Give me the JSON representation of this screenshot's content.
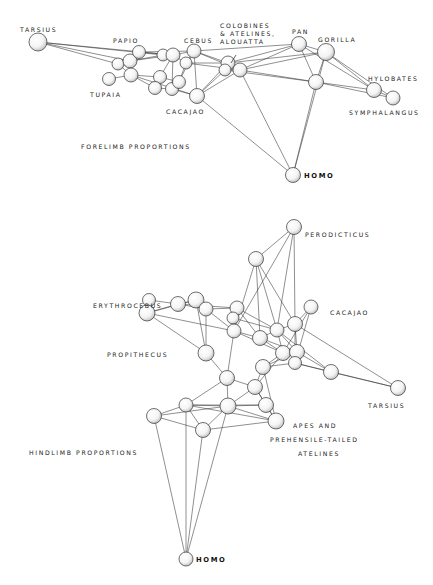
{
  "diagrams": [
    {
      "id": "forelimb",
      "title": "FORELIMB PROPORTIONS",
      "labels": [
        {
          "text": "TARSIUS",
          "x": 20,
          "y": 26
        },
        {
          "text": "PAPIO",
          "x": 113,
          "y": 37
        },
        {
          "text": "CEBUS",
          "x": 184,
          "y": 37
        },
        {
          "text": "COLOBINES\n& ATELINES,\nALOUATTA",
          "x": 220,
          "y": 22
        },
        {
          "text": "PAN",
          "x": 292,
          "y": 28
        },
        {
          "text": "GORILLA",
          "x": 318,
          "y": 36
        },
        {
          "text": "HYLOBATES",
          "x": 368,
          "y": 75
        },
        {
          "text": "SYMPHALANGUS",
          "x": 349,
          "y": 109
        },
        {
          "text": "TUPAIA",
          "x": 90,
          "y": 91
        },
        {
          "text": "CACAJAO",
          "x": 166,
          "y": 108
        },
        {
          "text": "FORELIMB PROPORTIONS",
          "x": 81,
          "y": 143
        },
        {
          "text": "HOMO",
          "x": 304,
          "y": 172,
          "bold": true
        }
      ],
      "nodes": [
        {
          "id": "tarsius",
          "x": 38,
          "y": 42,
          "r": 9
        },
        {
          "id": "p1",
          "x": 118,
          "y": 64,
          "r": 6
        },
        {
          "id": "p2",
          "x": 130,
          "y": 61,
          "r": 7
        },
        {
          "id": "papio",
          "x": 139,
          "y": 52,
          "r": 6.5
        },
        {
          "id": "p3",
          "x": 131,
          "y": 75,
          "r": 7
        },
        {
          "id": "tupaia",
          "x": 109,
          "y": 79,
          "r": 6.5
        },
        {
          "id": "c1",
          "x": 163,
          "y": 55,
          "r": 6
        },
        {
          "id": "c2",
          "x": 173,
          "y": 55,
          "r": 7
        },
        {
          "id": "cebus",
          "x": 194,
          "y": 51,
          "r": 7
        },
        {
          "id": "c3",
          "x": 186,
          "y": 63,
          "r": 6
        },
        {
          "id": "m1",
          "x": 160,
          "y": 77,
          "r": 6.5
        },
        {
          "id": "m2",
          "x": 155,
          "y": 88,
          "r": 6.5
        },
        {
          "id": "m3",
          "x": 172,
          "y": 89,
          "r": 6.5
        },
        {
          "id": "m4",
          "x": 179,
          "y": 82,
          "r": 6.5
        },
        {
          "id": "cacajao",
          "x": 197,
          "y": 96,
          "r": 7.5
        },
        {
          "id": "col1",
          "x": 228,
          "y": 63,
          "r": 7
        },
        {
          "id": "col2",
          "x": 225,
          "y": 70,
          "r": 6
        },
        {
          "id": "col3",
          "x": 240,
          "y": 70,
          "r": 7
        },
        {
          "id": "pan",
          "x": 299,
          "y": 44,
          "r": 7.5
        },
        {
          "id": "gorilla",
          "x": 326,
          "y": 52,
          "r": 8.5
        },
        {
          "id": "mid",
          "x": 316,
          "y": 82,
          "r": 7.5
        },
        {
          "id": "hylobates",
          "x": 374,
          "y": 90,
          "r": 7.5
        },
        {
          "id": "symphalangus",
          "x": 393,
          "y": 98,
          "r": 7
        },
        {
          "id": "homo",
          "x": 293,
          "y": 175,
          "r": 7.5
        }
      ],
      "edges": [
        [
          "tarsius",
          "p1"
        ],
        [
          "tarsius",
          "p2"
        ],
        [
          "tarsius",
          "c1"
        ],
        [
          "tarsius",
          "c2"
        ],
        [
          "p1",
          "p2"
        ],
        [
          "p1",
          "p3"
        ],
        [
          "p2",
          "papio"
        ],
        [
          "p2",
          "p3"
        ],
        [
          "p2",
          "c1"
        ],
        [
          "p2",
          "c2"
        ],
        [
          "papio",
          "c2"
        ],
        [
          "papio",
          "cebus"
        ],
        [
          "p3",
          "m1"
        ],
        [
          "p3",
          "m2"
        ],
        [
          "p3",
          "cacajao"
        ],
        [
          "tupaia",
          "p3"
        ],
        [
          "c1",
          "c2"
        ],
        [
          "c2",
          "cebus"
        ],
        [
          "c2",
          "c3"
        ],
        [
          "c3",
          "cebus"
        ],
        [
          "c3",
          "m4"
        ],
        [
          "c2",
          "m1"
        ],
        [
          "c2",
          "m3"
        ],
        [
          "m1",
          "m2"
        ],
        [
          "m1",
          "m4"
        ],
        [
          "m2",
          "m3"
        ],
        [
          "m3",
          "m4"
        ],
        [
          "m4",
          "cebus"
        ],
        [
          "m3",
          "cacajao"
        ],
        [
          "cebus",
          "col1"
        ],
        [
          "cebus",
          "col3"
        ],
        [
          "cebus",
          "pan"
        ],
        [
          "cebus",
          "cacajao"
        ],
        [
          "c3",
          "col1"
        ],
        [
          "c3",
          "col3"
        ],
        [
          "col1",
          "col2"
        ],
        [
          "col1",
          "col3"
        ],
        [
          "col2",
          "col3"
        ],
        [
          "col1",
          "pan"
        ],
        [
          "col3",
          "pan"
        ],
        [
          "col3",
          "gorilla"
        ],
        [
          "col1",
          "gorilla"
        ],
        [
          "col3",
          "mid"
        ],
        [
          "col2",
          "mid"
        ],
        [
          "cacajao",
          "col1"
        ],
        [
          "cacajao",
          "col3"
        ],
        [
          "cacajao",
          "col2"
        ],
        [
          "pan",
          "gorilla"
        ],
        [
          "pan",
          "mid"
        ],
        [
          "gorilla",
          "mid"
        ],
        [
          "gorilla",
          "hylobates"
        ],
        [
          "pan",
          "hylobates"
        ],
        [
          "mid",
          "hylobates"
        ],
        [
          "mid",
          "symphalangus"
        ],
        [
          "hylobates",
          "symphalangus"
        ],
        [
          "gorilla",
          "symphalangus"
        ],
        [
          "homo",
          "cacajao"
        ],
        [
          "homo",
          "col3"
        ],
        [
          "homo",
          "gorilla"
        ],
        [
          "homo",
          "mid"
        ]
      ]
    },
    {
      "id": "hindlimb",
      "title": "HINDLIMB PROPORTIONS",
      "labels": [
        {
          "text": "PERODICTICUS",
          "x": 305,
          "y": 231
        },
        {
          "text": "ERYTHROCEBUS",
          "x": 93,
          "y": 302
        },
        {
          "text": "CACAJAO",
          "x": 330,
          "y": 309
        },
        {
          "text": "PROPITHECUS",
          "x": 107,
          "y": 351
        },
        {
          "text": "TARSIUS",
          "x": 368,
          "y": 402
        },
        {
          "text": "APES  AND",
          "x": 293,
          "y": 422
        },
        {
          "text": "PREHENSILE-TAILED",
          "x": 270,
          "y": 436
        },
        {
          "text": "ATELINES",
          "x": 298,
          "y": 450
        },
        {
          "text": "HINDLIMB PROPORTIONS",
          "x": 29,
          "y": 449
        },
        {
          "text": "HOMO",
          "x": 196,
          "y": 556,
          "bold": true
        }
      ],
      "nodes": [
        {
          "id": "perodicticus",
          "x": 294,
          "y": 227,
          "r": 7.5
        },
        {
          "id": "n2",
          "x": 256,
          "y": 259,
          "r": 7.5
        },
        {
          "id": "e1",
          "x": 196,
          "y": 300,
          "r": 8
        },
        {
          "id": "e2",
          "x": 206,
          "y": 309,
          "r": 7
        },
        {
          "id": "pr1",
          "x": 149,
          "y": 300,
          "r": 6.5
        },
        {
          "id": "pr2",
          "x": 147,
          "y": 313,
          "r": 8
        },
        {
          "id": "e3",
          "x": 178,
          "y": 304,
          "r": 7.5
        },
        {
          "id": "k1",
          "x": 237,
          "y": 308,
          "r": 7
        },
        {
          "id": "k2",
          "x": 233,
          "y": 318,
          "r": 6
        },
        {
          "id": "propithecus",
          "x": 206,
          "y": 353,
          "r": 8
        },
        {
          "id": "k3",
          "x": 234,
          "y": 331,
          "r": 7
        },
        {
          "id": "k4",
          "x": 260,
          "y": 338,
          "r": 7.5
        },
        {
          "id": "k5",
          "x": 277,
          "y": 330,
          "r": 7
        },
        {
          "id": "k6",
          "x": 295,
          "y": 324,
          "r": 7.5
        },
        {
          "id": "cacajao",
          "x": 311,
          "y": 307,
          "r": 7
        },
        {
          "id": "k7",
          "x": 283,
          "y": 353,
          "r": 7.5
        },
        {
          "id": "k8",
          "x": 297,
          "y": 352,
          "r": 7.5
        },
        {
          "id": "k9",
          "x": 263,
          "y": 367,
          "r": 7.5
        },
        {
          "id": "k10",
          "x": 295,
          "y": 363,
          "r": 6.5
        },
        {
          "id": "k11",
          "x": 227,
          "y": 378,
          "r": 7.5
        },
        {
          "id": "k12",
          "x": 255,
          "y": 387,
          "r": 7.5
        },
        {
          "id": "k13",
          "x": 266,
          "y": 405,
          "r": 7.5
        },
        {
          "id": "k14",
          "x": 331,
          "y": 372,
          "r": 7.5
        },
        {
          "id": "tarsius",
          "x": 398,
          "y": 388,
          "r": 7.5
        },
        {
          "id": "h1",
          "x": 186,
          "y": 405,
          "r": 7
        },
        {
          "id": "h2",
          "x": 228,
          "y": 406,
          "r": 8
        },
        {
          "id": "h3",
          "x": 154,
          "y": 416,
          "r": 7.5
        },
        {
          "id": "h4",
          "x": 203,
          "y": 430,
          "r": 7.5
        },
        {
          "id": "apes",
          "x": 276,
          "y": 421,
          "r": 8
        },
        {
          "id": "homo",
          "x": 186,
          "y": 559,
          "r": 7
        }
      ],
      "edges": [
        [
          "perodicticus",
          "n2"
        ],
        [
          "perodicticus",
          "k5"
        ],
        [
          "perodicticus",
          "k6"
        ],
        [
          "perodicticus",
          "k3"
        ],
        [
          "n2",
          "k4"
        ],
        [
          "n2",
          "k6"
        ],
        [
          "n2",
          "k3"
        ],
        [
          "n2",
          "k5"
        ],
        [
          "pr1",
          "pr2"
        ],
        [
          "pr2",
          "e3"
        ],
        [
          "pr2",
          "e1"
        ],
        [
          "pr2",
          "k3"
        ],
        [
          "pr2",
          "propithecus"
        ],
        [
          "pr1",
          "e3"
        ],
        [
          "e1",
          "e2"
        ],
        [
          "e1",
          "e3"
        ],
        [
          "e2",
          "e3"
        ],
        [
          "e2",
          "k1"
        ],
        [
          "e2",
          "k3"
        ],
        [
          "e1",
          "propithecus"
        ],
        [
          "e2",
          "propithecus"
        ],
        [
          "e3",
          "k1"
        ],
        [
          "k1",
          "k2"
        ],
        [
          "k1",
          "k3"
        ],
        [
          "k2",
          "k3"
        ],
        [
          "k1",
          "k4"
        ],
        [
          "k1",
          "k5"
        ],
        [
          "k3",
          "k4"
        ],
        [
          "k3",
          "k7"
        ],
        [
          "k2",
          "k5"
        ],
        [
          "k4",
          "k5"
        ],
        [
          "k4",
          "k7"
        ],
        [
          "k4",
          "k8"
        ],
        [
          "k5",
          "k6"
        ],
        [
          "k5",
          "k7"
        ],
        [
          "k5",
          "k8"
        ],
        [
          "k6",
          "cacajao"
        ],
        [
          "k6",
          "k8"
        ],
        [
          "k6",
          "k10"
        ],
        [
          "cacajao",
          "k7"
        ],
        [
          "cacajao",
          "k10"
        ],
        [
          "k6",
          "tarsius"
        ],
        [
          "k10",
          "tarsius"
        ],
        [
          "k10",
          "k14"
        ],
        [
          "k8",
          "k14"
        ],
        [
          "k5",
          "k14"
        ],
        [
          "k7",
          "k8"
        ],
        [
          "k7",
          "k9"
        ],
        [
          "k8",
          "k9"
        ],
        [
          "k9",
          "k10"
        ],
        [
          "k9",
          "k12"
        ],
        [
          "k7",
          "k12"
        ],
        [
          "propithecus",
          "k11"
        ],
        [
          "k3",
          "k11"
        ],
        [
          "k11",
          "k12"
        ],
        [
          "k11",
          "h2"
        ],
        [
          "k11",
          "h1"
        ],
        [
          "k12",
          "k13"
        ],
        [
          "k12",
          "h2"
        ],
        [
          "k13",
          "apes"
        ],
        [
          "k13",
          "h2"
        ],
        [
          "k9",
          "apes"
        ],
        [
          "k12",
          "apes"
        ],
        [
          "k14",
          "tarsius"
        ],
        [
          "h1",
          "h2"
        ],
        [
          "h1",
          "h3"
        ],
        [
          "h1",
          "h4"
        ],
        [
          "h3",
          "h4"
        ],
        [
          "h3",
          "h2"
        ],
        [
          "h2",
          "h4"
        ],
        [
          "h2",
          "apes"
        ],
        [
          "h1",
          "apes"
        ],
        [
          "h4",
          "apes"
        ],
        [
          "h1",
          "k13"
        ],
        [
          "homo",
          "h3"
        ],
        [
          "homo",
          "h1"
        ],
        [
          "homo",
          "h4"
        ],
        [
          "homo",
          "h2"
        ]
      ]
    }
  ]
}
